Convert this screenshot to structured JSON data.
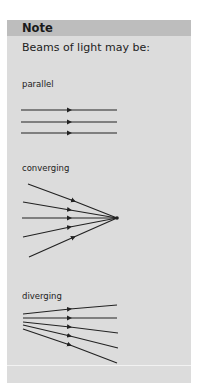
{
  "note": {
    "title": "Note",
    "intro": "Beams of light may be:",
    "beams": [
      {
        "label": "parallel",
        "type": "parallel",
        "ray_count": 3
      },
      {
        "label": "converging",
        "type": "converging",
        "ray_count": 5
      },
      {
        "label": "diverging",
        "type": "diverging",
        "ray_count": 5
      }
    ]
  },
  "colors": {
    "panel_background": "#dcdcdc",
    "header_background": "#bdbdbd",
    "ray_color": "#222222"
  }
}
